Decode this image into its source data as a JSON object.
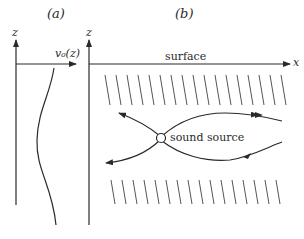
{
  "panel_a": {
    "label": "(a)",
    "axis_z": "z",
    "profile_label": "v₀(z)"
  },
  "panel_b": {
    "label": "(b)",
    "axis_z": "z",
    "axis_x": "x",
    "surface_label": "surface",
    "source_label": "sound source"
  },
  "colors": {
    "ink": "#2a2a2a",
    "hatch": "#555555",
    "background": "#ffffff"
  }
}
